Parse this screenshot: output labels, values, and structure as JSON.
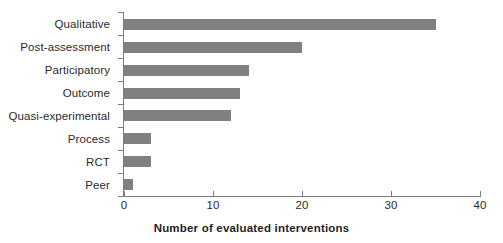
{
  "chart_data": {
    "type": "bar",
    "orientation": "horizontal",
    "title": "",
    "subtitle": "",
    "xlabel": "Number of evaluated interventions",
    "ylabel": "",
    "categories": [
      "Qualitative",
      "Post-assessment",
      "Participatory",
      "Outcome",
      "Quasi-experimental",
      "Process",
      "RCT",
      "Peer"
    ],
    "values": [
      35,
      20,
      14,
      13,
      12,
      3,
      3,
      1
    ],
    "xlim": [
      0,
      40
    ],
    "xticks": [
      0,
      10,
      20,
      30,
      40
    ],
    "xtick_labels": [
      "0",
      "10",
      "20",
      "30",
      "40"
    ],
    "grid": false,
    "legend": null,
    "bar_color": "#808080",
    "axis_color": "#7d7d7d",
    "text_color": "#2b2b2b",
    "background": "#ffffff"
  }
}
